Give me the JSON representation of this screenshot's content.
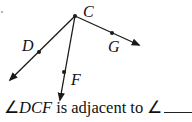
{
  "diagram": {
    "vertex": {
      "label": "C",
      "x": 75,
      "y": 16
    },
    "rays": [
      {
        "name": "CD",
        "point_label": "D",
        "point": [
          39,
          52
        ],
        "end": [
          10,
          80
        ]
      },
      {
        "name": "CF",
        "point_label": "F",
        "point": [
          64,
          72
        ],
        "end": [
          60,
          100
        ]
      },
      {
        "name": "CG",
        "point_label": "G",
        "point": [
          112,
          33
        ],
        "end": [
          139,
          45
        ]
      }
    ],
    "stray_dot": [
      2,
      12
    ]
  },
  "labels": {
    "C": "C",
    "D": "D",
    "F": "F",
    "G": "G"
  },
  "question": {
    "angle_symbol": "∠",
    "angle_name": "DCF",
    "text": " is adjacent to ",
    "angle_symbol_2": "∠",
    "blank": ""
  },
  "colors": {
    "stroke": "#1a1a1a",
    "background": "#ffffff"
  }
}
